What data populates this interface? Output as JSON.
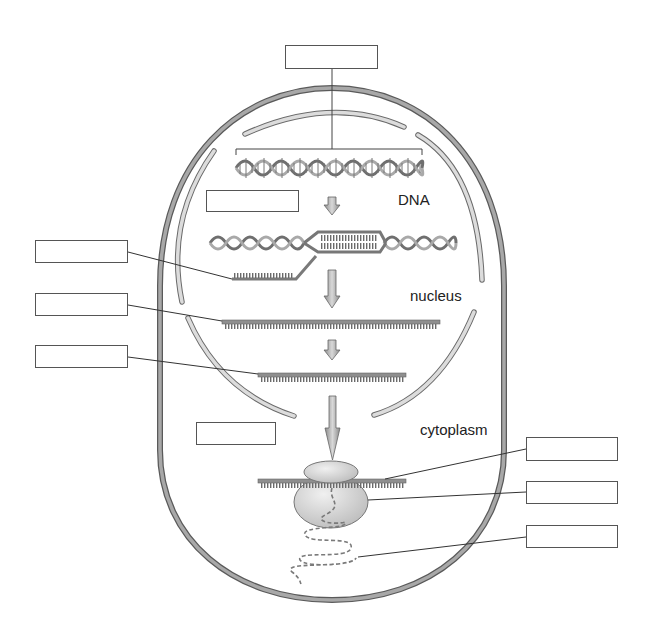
{
  "diagram": {
    "labels": {
      "dna": "DNA",
      "nucleus": "nucleus",
      "cytoplasm": "cytoplasm"
    },
    "blank_label_boxes": [
      {
        "id": "box-gene",
        "points_to": "gene segment of DNA",
        "value": ""
      },
      {
        "id": "box-transcription",
        "points_to": "process arrow DNA to pre-mRNA",
        "value": ""
      },
      {
        "id": "box-rna-transcript",
        "points_to": "RNA strand being transcribed",
        "value": ""
      },
      {
        "id": "box-pre-mrna",
        "points_to": "pre-mRNA",
        "value": ""
      },
      {
        "id": "box-mrna",
        "points_to": "mature mRNA",
        "value": ""
      },
      {
        "id": "box-translation",
        "points_to": "process arrow mRNA to ribosome",
        "value": ""
      },
      {
        "id": "box-mrna-ribosome",
        "points_to": "mRNA on ribosome",
        "value": ""
      },
      {
        "id": "box-ribosome",
        "points_to": "ribosome",
        "value": ""
      },
      {
        "id": "box-polypeptide",
        "points_to": "polypeptide chain",
        "value": ""
      }
    ],
    "colors": {
      "membrane": "#9a9a9a",
      "membrane_edge": "#5a5a5a",
      "nuclear_envelope": "#d6d6d6",
      "strand": "#8c8c8c",
      "ribosome": "#d9d9d9",
      "leader": "#333333"
    }
  }
}
